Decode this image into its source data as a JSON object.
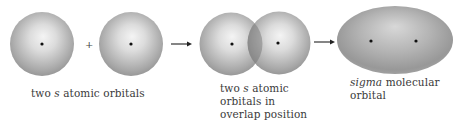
{
  "diagram": {
    "stages": [
      {
        "id": "separate",
        "label_parts": [
          "two ",
          "s",
          " atomic orbitals"
        ]
      },
      {
        "id": "overlap",
        "label_lines": [
          [
            "two ",
            "s",
            " atomic"
          ],
          [
            "orbitals in"
          ],
          [
            "overlap position"
          ]
        ]
      },
      {
        "id": "sigma",
        "label_lines": [
          [
            "sigma",
            " molecular"
          ],
          [
            "orbital"
          ]
        ]
      }
    ],
    "operators": {
      "plus": "+",
      "arrow1": "→",
      "arrow2": "→"
    },
    "colors": {
      "orbital_light": "#e6e6e6",
      "orbital_dark": "#8c8c8c",
      "nucleus": "#111111",
      "overlap_region": "#7a7a7a"
    }
  }
}
